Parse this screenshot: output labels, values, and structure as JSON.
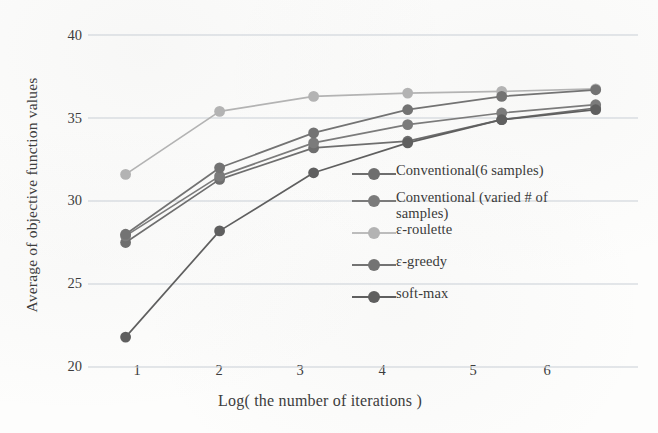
{
  "chart_data": {
    "type": "line",
    "title": "",
    "xlabel": "Log( the number of iterations )",
    "ylabel": "Average of objective function values",
    "x": [
      1,
      2,
      3,
      4,
      5,
      6
    ],
    "xticklabels": [
      "1",
      "2",
      "3",
      "4",
      "5",
      "6"
    ],
    "yticklabels": [
      "20",
      "25",
      "30",
      "35",
      "40"
    ],
    "yticks": [
      20,
      25,
      30,
      35,
      40
    ],
    "xlim": [
      0.6,
      6.45
    ],
    "ylim": [
      20,
      40
    ],
    "grid": "horizontal",
    "legend_position": "inside-right",
    "series": [
      {
        "name": "Conventional(6 samples)",
        "color": "#6e6e6e",
        "values": [
          27.5,
          31.3,
          33.2,
          33.6,
          34.9,
          35.6
        ]
      },
      {
        "name": "Conventional (varied # of samples)",
        "color": "#7b7b7b",
        "values": [
          27.9,
          31.5,
          33.5,
          34.6,
          35.3,
          35.8
        ]
      },
      {
        "name": "ε-roulette",
        "color": "#b3b3b3",
        "values": [
          31.6,
          35.4,
          36.3,
          36.5,
          36.6,
          36.75
        ]
      },
      {
        "name": "ε-greedy",
        "color": "#737373",
        "values": [
          28.0,
          32.0,
          34.1,
          35.5,
          36.3,
          36.7
        ]
      },
      {
        "name": "soft-max",
        "color": "#5f5f5f",
        "values": [
          21.8,
          28.2,
          31.7,
          33.5,
          34.9,
          35.5
        ]
      }
    ]
  },
  "legend": {
    "items": [
      {
        "label": "Conventional(6 samples)"
      },
      {
        "label": "Conventional (varied # of"
      },
      {
        "label": "samples)"
      },
      {
        "label": "ε-roulette"
      },
      {
        "label": "ε-greedy"
      },
      {
        "label": "soft-max"
      }
    ]
  }
}
